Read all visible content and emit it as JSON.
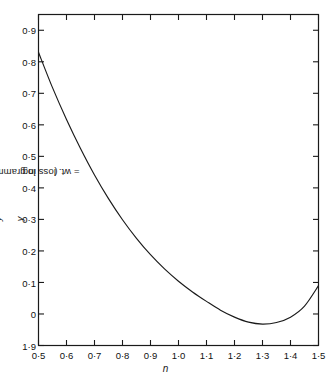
{
  "chart_data": {
    "type": "line",
    "title": "",
    "xlabel": "n",
    "ylabel": "log y ( y = wt. loss in grammes)",
    "ylabel_parts": {
      "prefix": "log ",
      "var1": "y",
      "mid": " ( ",
      "var2": "y",
      "suffix": " = wt. loss in grammes)"
    },
    "xlim": [
      0.5,
      1.5
    ],
    "ylim": [
      -0.1,
      0.95
    ],
    "grid": false,
    "legend": false,
    "decimal_separator": "middle-dot",
    "xticks": [
      0.5,
      0.6,
      0.7,
      0.8,
      0.9,
      1.0,
      1.1,
      1.2,
      1.3,
      1.4,
      1.5
    ],
    "xticklabels": [
      "0·5",
      "0·6",
      "0·7",
      "0·8",
      "0·9",
      "1·0",
      "1·1",
      "1·2",
      "1·3",
      "1·4",
      "1·5"
    ],
    "yticks": [
      0.9,
      0.8,
      0.7,
      0.6,
      0.5,
      0.4,
      0.3,
      0.2,
      0.1,
      0.0,
      -0.1
    ],
    "yticklabels": [
      "0·9",
      "0·8",
      "0·7",
      "0·6",
      "0·5",
      "0·4",
      "0·3",
      "0·2",
      "0·1",
      "0",
      "1·9"
    ],
    "ytick_note": "lowest label 1·9 is bar-notation for -0·1",
    "series": [
      {
        "name": "log y vs n",
        "color": "#1a1a1a",
        "x": [
          0.5,
          0.55,
          0.6,
          0.65,
          0.7,
          0.75,
          0.8,
          0.85,
          0.9,
          0.95,
          1.0,
          1.05,
          1.1,
          1.15,
          1.2,
          1.25,
          1.3,
          1.35,
          1.4,
          1.45,
          1.5
        ],
        "y": [
          0.83,
          0.718,
          0.617,
          0.525,
          0.441,
          0.366,
          0.299,
          0.24,
          0.188,
          0.143,
          0.104,
          0.07,
          0.04,
          0.012,
          -0.01,
          -0.026,
          -0.032,
          -0.027,
          -0.01,
          0.025,
          0.09
        ]
      }
    ],
    "curve_points": {
      "start": [
        0.5,
        0.83
      ],
      "minimum": [
        1.12,
        -0.095
      ],
      "end": [
        1.5,
        0.09
      ]
    }
  },
  "axes": {
    "frame": true,
    "tick_direction": "in",
    "ticks_on_sides": [
      "left",
      "bottom",
      "top",
      "right"
    ],
    "line_color": "#1a1a1a"
  }
}
